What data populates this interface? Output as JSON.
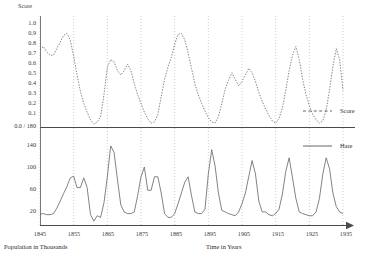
{
  "chart_data": {
    "type": "line",
    "title": "",
    "subtitle": "",
    "xlabel": "Time in Years",
    "ylabel_left_bottom": "Population in Thousands",
    "ylabel_top": "Score",
    "xlim": [
      1845,
      1935
    ],
    "grid": true,
    "grid_style": "dotted-vertical-at-decades",
    "legend_position": "right",
    "panels": [
      {
        "name": "score-panel",
        "ylabel": "Score",
        "ylim": [
          0.0,
          1.0
        ],
        "yticks": [
          0.0,
          0.1,
          0.2,
          0.3,
          0.4,
          0.5,
          0.6,
          0.7,
          0.8,
          0.9,
          1.0
        ],
        "ytick_labels": [
          "0.0 / 180",
          "0.1",
          "0.2",
          "0.3",
          "0.4",
          "0.5",
          "0.6",
          "0.7",
          "0.8",
          "0.9",
          "1.0"
        ],
        "axis_direction": "normal",
        "series_name": "Score",
        "line_style": "dashed"
      },
      {
        "name": "hare-panel",
        "ylabel": "Population in Thousands",
        "ylim": [
          0,
          180
        ],
        "yticks": [
          20,
          60,
          100,
          140,
          180
        ],
        "ytick_labels": [
          "20",
          "60",
          "100",
          "140",
          "0.0 / 180"
        ],
        "axis_direction": "inverted",
        "series_name": "Hare",
        "line_style": "solid"
      }
    ],
    "xticks": [
      1845,
      1855,
      1865,
      1875,
      1885,
      1895,
      1905,
      1915,
      1925,
      1935
    ],
    "xtick_labels": [
      "1845",
      "1855",
      "1865",
      "1875",
      "1885",
      "1895",
      "1905",
      "1915",
      "1925",
      "1935"
    ],
    "legend": [
      {
        "label": "Score",
        "style": "dashed",
        "color": "#555555"
      },
      {
        "label": "Hare",
        "style": "solid",
        "color": "#555555"
      }
    ],
    "x": [
      1845,
      1846,
      1847,
      1848,
      1849,
      1850,
      1851,
      1852,
      1853,
      1854,
      1855,
      1856,
      1857,
      1858,
      1859,
      1860,
      1861,
      1862,
      1863,
      1864,
      1865,
      1866,
      1867,
      1868,
      1869,
      1870,
      1871,
      1872,
      1873,
      1874,
      1875,
      1876,
      1877,
      1878,
      1879,
      1880,
      1881,
      1882,
      1883,
      1884,
      1885,
      1886,
      1887,
      1888,
      1889,
      1890,
      1891,
      1892,
      1893,
      1894,
      1895,
      1896,
      1897,
      1898,
      1899,
      1900,
      1901,
      1902,
      1903,
      1904,
      1905,
      1906,
      1907,
      1908,
      1909,
      1910,
      1911,
      1912,
      1913,
      1914,
      1915,
      1916,
      1917,
      1918,
      1919,
      1920,
      1921,
      1922,
      1923,
      1924,
      1925,
      1926,
      1927,
      1928,
      1929,
      1930,
      1931,
      1932,
      1933,
      1934,
      1935
    ],
    "series": [
      {
        "name": "Hare",
        "units": "thousands",
        "values": [
          21,
          22,
          20,
          20,
          22,
          32,
          45,
          59,
          72,
          88,
          91,
          70,
          70,
          88,
          70,
          20,
          8,
          18,
          15,
          42,
          90,
          147,
          135,
          85,
          38,
          25,
          22,
          22,
          25,
          55,
          90,
          108,
          65,
          65,
          90,
          90,
          60,
          22,
          15,
          15,
          22,
          40,
          60,
          80,
          90,
          55,
          25,
          22,
          22,
          30,
          95,
          140,
          110,
          60,
          28,
          25,
          22,
          20,
          18,
          25,
          40,
          60,
          90,
          120,
          95,
          45,
          25,
          25,
          20,
          18,
          22,
          30,
          58,
          100,
          125,
          88,
          50,
          25,
          22,
          20,
          18,
          18,
          25,
          50,
          95,
          125,
          105,
          60,
          35,
          25,
          22
        ]
      },
      {
        "name": "Score",
        "units": "normalized 0-1",
        "values": [
          0.71,
          0.74,
          0.69,
          0.66,
          0.66,
          0.72,
          0.78,
          0.84,
          0.86,
          0.8,
          0.65,
          0.48,
          0.33,
          0.22,
          0.14,
          0.07,
          0.03,
          0.05,
          0.1,
          0.3,
          0.55,
          0.62,
          0.6,
          0.52,
          0.48,
          0.52,
          0.58,
          0.52,
          0.4,
          0.3,
          0.22,
          0.14,
          0.08,
          0.04,
          0.05,
          0.12,
          0.28,
          0.44,
          0.55,
          0.64,
          0.76,
          0.85,
          0.86,
          0.8,
          0.68,
          0.54,
          0.4,
          0.3,
          0.22,
          0.15,
          0.09,
          0.05,
          0.04,
          0.1,
          0.22,
          0.35,
          0.43,
          0.5,
          0.44,
          0.38,
          0.42,
          0.48,
          0.54,
          0.5,
          0.42,
          0.32,
          0.24,
          0.17,
          0.11,
          0.06,
          0.04,
          0.08,
          0.18,
          0.34,
          0.52,
          0.66,
          0.74,
          0.62,
          0.44,
          0.3,
          0.2,
          0.12,
          0.07,
          0.04,
          0.06,
          0.16,
          0.34,
          0.56,
          0.72,
          0.62,
          0.34
        ]
      }
    ]
  },
  "legend": {
    "score_label": "Score",
    "hare_label": "Hare"
  },
  "axes": {
    "top_title": "Score",
    "bottom_left_title": "Population in Thousands",
    "bottom_center_title": "Time in Years"
  },
  "ticks": {
    "top_y": [
      "1.0",
      "0.9",
      "0.8",
      "0.7",
      "0.6",
      "0.5",
      "0.4",
      "0.3",
      "0.2",
      "0.1",
      "0.0 / 180"
    ],
    "bottom_y": [
      "140",
      "100",
      "60",
      "20"
    ],
    "x": [
      "1845",
      "1855",
      "1865",
      "1875",
      "1885",
      "1895",
      "1905",
      "1915",
      "1925",
      "1935"
    ]
  }
}
